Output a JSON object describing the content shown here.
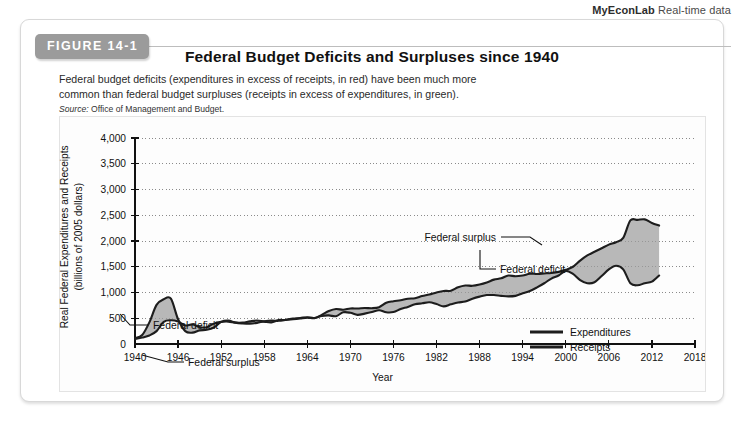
{
  "econlab": {
    "brand": "MyEconLab",
    "suffix": "Real-time data"
  },
  "figure": {
    "tab_label": "FIGURE 14-1",
    "title": "Federal Budget Deficits and Surpluses since 1940",
    "caption": "Federal budget deficits (expenditures in excess of receipts, in red) have been much more common than federal budget surpluses (receipts in excess of expenditures, in green).",
    "source_label": "Source:",
    "source_text": "Office of Management and Budget."
  },
  "annotations": {
    "deficit_left": "Federal deficit",
    "surplus_left": "Federal surplus",
    "surplus_right": "Federal surplus",
    "deficit_right": "Federal deficit"
  },
  "legend": {
    "items": [
      {
        "label": "Expenditures",
        "color": "#1d1d1d"
      },
      {
        "label": "Receipts",
        "color": "#1d1d1d"
      }
    ]
  },
  "colors": {
    "tab_background": "#9b9b9b",
    "fill_gap": "#9d9d9d",
    "line": "#1d1d1d",
    "grid": "#8a8a8a"
  },
  "chart_data": {
    "type": "area",
    "title": "Federal Budget Deficits and Surpluses since 1940",
    "xlabel": "Year",
    "ylabel": "Real Federal Expenditures and Receipts (billions of 2005 dollars)",
    "ylabel_line1": "Real Federal Expenditures and Receipts",
    "ylabel_line2": "(billions of 2005 dollars)",
    "xlim": [
      1940,
      2018
    ],
    "ylim": [
      0,
      4000
    ],
    "ytick_values": [
      0,
      500,
      1000,
      1500,
      2000,
      2500,
      3000,
      3500,
      4000
    ],
    "ytick_labels": [
      "0",
      "500",
      "1,000",
      "1,500",
      "2,000",
      "2,500",
      "3,000",
      "3,500",
      "4,000"
    ],
    "xtick_values": [
      1940,
      1946,
      1952,
      1958,
      1964,
      1970,
      1976,
      1982,
      1988,
      1994,
      2000,
      2006,
      2012,
      2018
    ],
    "xtick_labels": [
      "1940",
      "1946",
      "1952",
      "1958",
      "1964",
      "1970",
      "1976",
      "1982",
      "1988",
      "1994",
      "2000",
      "2006",
      "2012",
      "2018"
    ],
    "grid": "horizontal-dotted",
    "legend_position": "bottom-right",
    "x": [
      1940,
      1941,
      1942,
      1943,
      1944,
      1945,
      1946,
      1947,
      1948,
      1949,
      1950,
      1951,
      1952,
      1953,
      1954,
      1955,
      1956,
      1957,
      1958,
      1959,
      1960,
      1961,
      1962,
      1963,
      1964,
      1965,
      1966,
      1967,
      1968,
      1969,
      1970,
      1971,
      1972,
      1973,
      1974,
      1975,
      1976,
      1977,
      1978,
      1979,
      1980,
      1981,
      1982,
      1983,
      1984,
      1985,
      1986,
      1987,
      1988,
      1989,
      1990,
      1991,
      1992,
      1993,
      1994,
      1995,
      1996,
      1997,
      1998,
      1999,
      2000,
      2001,
      2002,
      2003,
      2004,
      2005,
      2006,
      2007,
      2008,
      2009,
      2010,
      2011,
      2012,
      2013
    ],
    "series": [
      {
        "name": "Expenditures",
        "values": [
          115,
          175,
          420,
          760,
          870,
          880,
          480,
          250,
          220,
          265,
          275,
          320,
          430,
          455,
          415,
          400,
          395,
          410,
          440,
          455,
          450,
          470,
          495,
          505,
          520,
          505,
          565,
          640,
          680,
          665,
          690,
          690,
          700,
          695,
          715,
          800,
          830,
          850,
          880,
          890,
          930,
          960,
          1000,
          1030,
          1035,
          1100,
          1135,
          1130,
          1155,
          1195,
          1250,
          1275,
          1330,
          1315,
          1330,
          1365,
          1360,
          1370,
          1380,
          1400,
          1440,
          1500,
          1620,
          1720,
          1790,
          1860,
          1930,
          1975,
          2060,
          2400,
          2410,
          2420,
          2350,
          2300
        ],
        "color": "#1d1d1d"
      },
      {
        "name": "Receipts",
        "values": [
          95,
          125,
          165,
          250,
          430,
          460,
          435,
          360,
          380,
          330,
          325,
          400,
          430,
          435,
          415,
          415,
          440,
          455,
          435,
          420,
          465,
          465,
          480,
          495,
          510,
          500,
          545,
          555,
          540,
          615,
          605,
          565,
          590,
          620,
          655,
          615,
          620,
          680,
          720,
          770,
          790,
          810,
          775,
          730,
          770,
          805,
          825,
          880,
          920,
          950,
          950,
          935,
          925,
          935,
          985,
          1030,
          1100,
          1180,
          1270,
          1330,
          1420,
          1360,
          1240,
          1180,
          1200,
          1320,
          1450,
          1520,
          1450,
          1180,
          1140,
          1180,
          1210,
          1330
        ],
        "color": "#1d1d1d"
      }
    ]
  }
}
